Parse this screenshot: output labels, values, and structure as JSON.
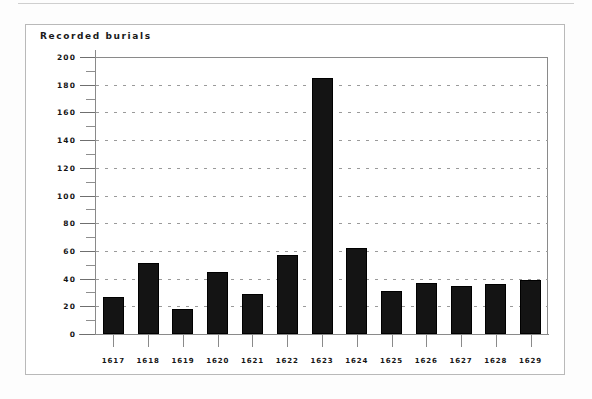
{
  "page": {
    "background_color": "#ffffff",
    "rule_color": "#cfcfcf",
    "frame_color": "#b9b9b9"
  },
  "chart_data": {
    "type": "bar",
    "title": "Recorded burials",
    "xlabel": "",
    "ylabel": "",
    "categories": [
      "1617",
      "1618",
      "1619",
      "1620",
      "1621",
      "1622",
      "1623",
      "1624",
      "1625",
      "1626",
      "1627",
      "1628",
      "1629"
    ],
    "values": [
      27,
      51,
      18,
      45,
      29,
      57,
      185,
      62,
      31,
      37,
      35,
      36,
      39
    ],
    "ylim": [
      0,
      200
    ],
    "ytick_labels": [
      "200",
      "180",
      "160",
      "140",
      "120",
      "100",
      "80",
      "60",
      "40",
      "20",
      "0"
    ],
    "ytick_values": [
      200,
      180,
      160,
      140,
      120,
      100,
      80,
      60,
      40,
      20,
      0
    ],
    "ytick_minor_values": [
      190,
      170,
      150,
      130,
      110,
      90,
      70,
      50,
      30,
      10
    ],
    "grid": true,
    "grid_style": "dotted-horizontal",
    "legend": "none",
    "bar_color": "#141414",
    "bar_edge_color": "#000000",
    "axis_color": "#8a8a8a",
    "grid_color": "#9a9a9a",
    "text_color": "#141414"
  }
}
